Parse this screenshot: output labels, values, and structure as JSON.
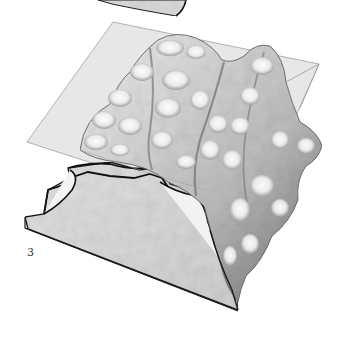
{
  "figure": {
    "panel_label": "3",
    "colors": {
      "plane_fill": "#e6e6e6",
      "plane_edge": "#9a9a9a",
      "block_face": "#d8d8d8",
      "outline": "#1a1a1a",
      "relief_light": "#f7f7f7",
      "relief_shade": "#7a7a7a"
    }
  }
}
